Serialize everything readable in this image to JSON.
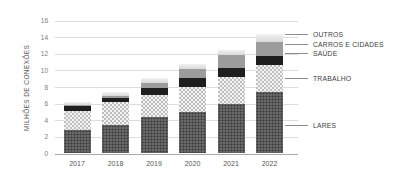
{
  "chart_data": {
    "type": "bar",
    "stacked": true,
    "title": "",
    "xlabel": "",
    "ylabel": "MILHÕES DE CONEXÕES",
    "ylim": [
      0,
      16
    ],
    "yticks": [
      0,
      2,
      4,
      6,
      8,
      10,
      12,
      14,
      16
    ],
    "grid": true,
    "legend_position": "right",
    "categories": [
      "2017",
      "2018",
      "2019",
      "2020",
      "2021",
      "2022"
    ],
    "series": [
      {
        "name": "LARES",
        "pattern": "lares",
        "values": [
          2.8,
          3.4,
          4.3,
          4.9,
          5.9,
          7.3
        ]
      },
      {
        "name": "TRABALHO",
        "pattern": "trabalho",
        "values": [
          2.3,
          2.7,
          2.7,
          3.0,
          3.3,
          3.3
        ]
      },
      {
        "name": "SAÚDE",
        "pattern": "saude",
        "values": [
          0.5,
          0.5,
          0.8,
          1.1,
          1.0,
          1.1
        ]
      },
      {
        "name": "CARROS E CIDADES",
        "pattern": "carros",
        "values": [
          0.2,
          0.3,
          0.6,
          1.1,
          1.6,
          1.6
        ]
      },
      {
        "name": "OUTROS",
        "pattern": "outros",
        "values": [
          0.3,
          0.4,
          0.6,
          0.6,
          0.6,
          1.0
        ]
      }
    ],
    "totals": [
      6.1,
      7.3,
      9.0,
      10.7,
      12.4,
      14.3
    ],
    "legend": [
      "OUTROS",
      "CARROS E CIDADES",
      "SAÚDE",
      "TRABALHO",
      "LARES"
    ]
  }
}
